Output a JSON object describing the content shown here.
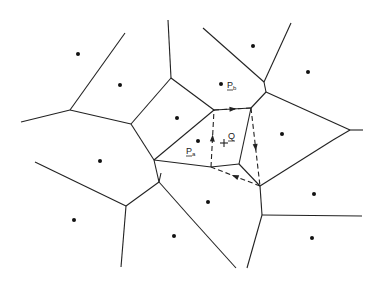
{
  "diagram": {
    "labels": {
      "query": "Q",
      "site_a": "P",
      "site_a_sub": "a",
      "site_b": "P",
      "site_b_sub": "b"
    },
    "sites": [
      {
        "id": "s1",
        "x": 78,
        "y": 54
      },
      {
        "id": "s2",
        "x": 120,
        "y": 85
      },
      {
        "id": "s3",
        "x": 177,
        "y": 118
      },
      {
        "id": "s4",
        "x": 253,
        "y": 46
      },
      {
        "id": "s5",
        "x": 308,
        "y": 72
      },
      {
        "id": "pb",
        "x": 221,
        "y": 84
      },
      {
        "id": "s7",
        "x": 282,
        "y": 134
      },
      {
        "id": "pa",
        "x": 198,
        "y": 141
      },
      {
        "id": "s9",
        "x": 100,
        "y": 161
      },
      {
        "id": "s10",
        "x": 74,
        "y": 220
      },
      {
        "id": "s11",
        "x": 174,
        "y": 236
      },
      {
        "id": "s12",
        "x": 208,
        "y": 202
      },
      {
        "id": "s13",
        "x": 314,
        "y": 194
      },
      {
        "id": "s14",
        "x": 312,
        "y": 238
      }
    ],
    "edges": [
      [
        70,
        110,
        125,
        33
      ],
      [
        70,
        110,
        21,
        122
      ],
      [
        70,
        110,
        131,
        124
      ],
      [
        131,
        124,
        171,
        78
      ],
      [
        171,
        78,
        168,
        20
      ],
      [
        171,
        78,
        214,
        110
      ],
      [
        131,
        124,
        154,
        160
      ],
      [
        154,
        160,
        211,
        167
      ],
      [
        154,
        160,
        159,
        182
      ],
      [
        214,
        110,
        154,
        160
      ],
      [
        214,
        110,
        251,
        108
      ],
      [
        251,
        108,
        239,
        164
      ],
      [
        239,
        164,
        211,
        167
      ],
      [
        239,
        164,
        260,
        186
      ],
      [
        264,
        82,
        203,
        28
      ],
      [
        264,
        82,
        291,
        23
      ],
      [
        264,
        82,
        266,
        92
      ],
      [
        266,
        92,
        350,
        130
      ],
      [
        350,
        130,
        363,
        130
      ],
      [
        266,
        92,
        251,
        108
      ],
      [
        350,
        130,
        333,
        140
      ],
      [
        333,
        140,
        260,
        186
      ],
      [
        126,
        206,
        35,
        162
      ],
      [
        126,
        206,
        121,
        267
      ],
      [
        126,
        206,
        159,
        182
      ],
      [
        159,
        182,
        161,
        173
      ],
      [
        159,
        182,
        190,
        217
      ],
      [
        190,
        217,
        236,
        268
      ],
      [
        260,
        186,
        262,
        215
      ],
      [
        262,
        215,
        362,
        216
      ],
      [
        262,
        215,
        247,
        268
      ]
    ],
    "walk_path": [
      [
        214,
        110
      ],
      [
        251,
        108
      ],
      [
        260,
        186
      ],
      [
        211,
        167
      ],
      [
        214,
        110
      ]
    ],
    "query_point": {
      "x": 224,
      "y": 143
    }
  }
}
